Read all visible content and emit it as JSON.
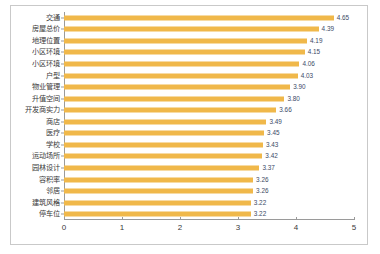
{
  "chart_data": {
    "type": "bar",
    "orientation": "horizontal",
    "title": "",
    "subtitle": "",
    "xlabel": "",
    "ylabel": "",
    "xlim": [
      0,
      5
    ],
    "ylim": null,
    "grid": false,
    "legend": null,
    "legend_position": "none",
    "bar_color": "#f0b84a",
    "value_label_color": "#3b4a66",
    "axis_color": "#9a9a9a",
    "xticks": [
      "0",
      "1",
      "2",
      "3",
      "4",
      "5"
    ],
    "xtick_values": [
      0,
      1,
      2,
      3,
      4,
      5
    ],
    "categories": [
      "交通",
      "房屋总价",
      "地理位置",
      "小区环境",
      "小区环境",
      "户型",
      "物业管理",
      "升值空间",
      "开发商实力",
      "商店",
      "医疗",
      "学校",
      "运动场所",
      "园林设计",
      "容积率",
      "邻居",
      "建筑风格",
      "停车位"
    ],
    "values": [
      4.65,
      4.39,
      4.19,
      4.15,
      4.06,
      4.03,
      3.9,
      3.8,
      3.66,
      3.49,
      3.45,
      3.43,
      3.42,
      3.37,
      3.26,
      3.26,
      3.22,
      3.22
    ],
    "value_labels": [
      "4.65",
      "4.39",
      "4.19",
      "4.15",
      "4.06",
      "4.03",
      "3.90",
      "3.80",
      "3.66",
      "3.49",
      "3.45",
      "3.43",
      "3.42",
      "3.37",
      "3.26",
      "3.26",
      "3.22",
      "3.22"
    ]
  }
}
